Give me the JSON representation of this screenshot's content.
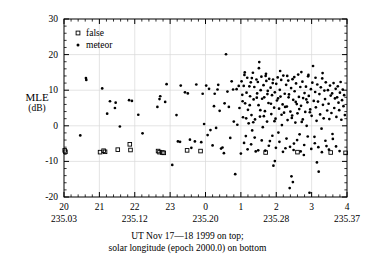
{
  "figure": {
    "title": "",
    "background_color": "#ffffff",
    "frame_color": "#000000",
    "grid_color": "#d8d8d8"
  },
  "axis_label_y": {
    "name": "MLE",
    "unit": "(dB)"
  },
  "caption": {
    "line1": "UT Nov 17—18 1999 on top;",
    "line2": "solar longitude (epoch 2000.0) on bottom"
  },
  "legend": {
    "entries": [
      {
        "label": "false",
        "marker": "open-square"
      },
      {
        "label": "meteor",
        "marker": "filled-dot"
      }
    ]
  },
  "chart_data": {
    "type": "scatter",
    "title": "",
    "xlabel": "UT Nov 17—18 1999 on top; solar longitude (epoch 2000.0) on bottom",
    "ylabel": "MLE (dB)",
    "xlim": [
      20.0,
      28.0
    ],
    "ylim": [
      -20,
      30
    ],
    "grid": true,
    "legend_position": "top-left",
    "x_axis_top_ticks": {
      "label": "UT Nov 17—18 1999",
      "tick_labels": [
        "20",
        "21",
        "22",
        "23",
        "0",
        "1",
        "2",
        "3",
        "4"
      ],
      "tick_values": [
        20,
        21,
        22,
        23,
        24,
        25,
        26,
        27,
        28
      ],
      "minor_ticks_per_interval": 5
    },
    "x_axis_bottom_ticks": {
      "label": "solar longitude (epoch 2000.0)",
      "tick_labels": [
        "235.03",
        "235.12",
        "235.20",
        "235.28",
        "235.37"
      ],
      "tick_values": [
        20,
        22,
        24,
        26,
        28
      ]
    },
    "y_axis_ticks": {
      "tick_labels": [
        "30",
        "20",
        "10",
        "0",
        "-10",
        "-20"
      ],
      "tick_values": [
        30,
        20,
        10,
        0,
        -10,
        -20
      ],
      "minor_tick_step": 2
    },
    "series": [
      {
        "name": "false",
        "marker": "open-square",
        "color": "#000000",
        "points": [
          [
            20.02,
            -6.9
          ],
          [
            20.04,
            -7.3
          ],
          [
            21.02,
            -7.4
          ],
          [
            21.12,
            -7.0
          ],
          [
            21.16,
            -7.3
          ],
          [
            21.52,
            -6.7
          ],
          [
            21.86,
            -5.2
          ],
          [
            21.88,
            -6.8
          ],
          [
            22.66,
            -7.1
          ],
          [
            22.7,
            -7.4
          ],
          [
            22.78,
            -7.5
          ],
          [
            22.82,
            -7.6
          ],
          [
            23.48,
            -6.9
          ],
          [
            23.86,
            -7.1
          ],
          [
            25.7,
            -7.5
          ],
          [
            26.6,
            -7.4
          ],
          [
            27.54,
            -7.5
          ],
          [
            27.96,
            -7.6
          ]
        ]
      },
      {
        "name": "meteor",
        "marker": "filled-dot",
        "color": "#000000",
        "points": [
          [
            20.62,
            13.4
          ],
          [
            20.63,
            12.9
          ],
          [
            20.46,
            -2.7
          ],
          [
            21.08,
            10.5
          ],
          [
            21.3,
            6.9
          ],
          [
            21.22,
            3.4
          ],
          [
            21.44,
            5.0
          ],
          [
            21.46,
            6.5
          ],
          [
            21.58,
            -0.2
          ],
          [
            21.84,
            7.2
          ],
          [
            21.92,
            7.0
          ],
          [
            22.1,
            3.1
          ],
          [
            22.22,
            -2.1
          ],
          [
            22.64,
            5.3
          ],
          [
            22.7,
            7.5
          ],
          [
            22.72,
            8.3
          ],
          [
            22.9,
            11.7
          ],
          [
            22.86,
            6.7
          ],
          [
            23.06,
            -11.0
          ],
          [
            23.18,
            3.0
          ],
          [
            23.22,
            -4.4
          ],
          [
            23.28,
            -4.5
          ],
          [
            23.3,
            11.3
          ],
          [
            23.42,
            9.4
          ],
          [
            23.5,
            9.1
          ],
          [
            23.56,
            -3.9
          ],
          [
            23.6,
            -6.2
          ],
          [
            23.7,
            -4.4
          ],
          [
            23.74,
            11.6
          ],
          [
            23.88,
            -4.6
          ],
          [
            23.92,
            9.0
          ],
          [
            23.96,
            0.5
          ],
          [
            24.02,
            11.3
          ],
          [
            24.06,
            -2.6
          ],
          [
            24.1,
            10.4
          ],
          [
            24.14,
            -1.2
          ],
          [
            24.2,
            -5.5
          ],
          [
            24.24,
            5.5
          ],
          [
            24.26,
            9.0
          ],
          [
            24.3,
            -0.6
          ],
          [
            24.34,
            10.2
          ],
          [
            24.36,
            11.5
          ],
          [
            24.4,
            4.2
          ],
          [
            24.44,
            -6.4
          ],
          [
            24.48,
            -6.1
          ],
          [
            24.52,
            -7.7
          ],
          [
            24.54,
            6.3
          ],
          [
            24.58,
            20.1
          ],
          [
            24.62,
            9.6
          ],
          [
            24.66,
            5.3
          ],
          [
            24.7,
            -3.4
          ],
          [
            24.74,
            12.5
          ],
          [
            24.78,
            10.2
          ],
          [
            24.8,
            1.2
          ],
          [
            24.84,
            -13.6
          ],
          [
            24.88,
            10.3
          ],
          [
            24.9,
            0.3
          ],
          [
            24.94,
            11.2
          ],
          [
            24.96,
            5.0
          ],
          [
            25.0,
            -7.8
          ],
          [
            25.02,
            12.5
          ],
          [
            25.04,
            8.7
          ],
          [
            25.06,
            2.4
          ],
          [
            25.08,
            11.2
          ],
          [
            25.1,
            14.3
          ],
          [
            25.12,
            6.3
          ],
          [
            25.14,
            -2.9
          ],
          [
            25.16,
            9.3
          ],
          [
            25.18,
            13.5
          ],
          [
            25.2,
            4.5
          ],
          [
            25.22,
            0.7
          ],
          [
            25.24,
            11.1
          ],
          [
            25.26,
            8.3
          ],
          [
            25.28,
            12.2
          ],
          [
            25.3,
            3.0
          ],
          [
            25.32,
            -1.3
          ],
          [
            25.34,
            14.9
          ],
          [
            25.36,
            7.4
          ],
          [
            25.38,
            10.9
          ],
          [
            25.4,
            1.8
          ],
          [
            25.42,
            -7.2
          ],
          [
            25.44,
            13.0
          ],
          [
            25.46,
            9.1
          ],
          [
            25.48,
            12.3
          ],
          [
            25.5,
            5.8
          ],
          [
            25.52,
            17.9
          ],
          [
            25.54,
            2.6
          ],
          [
            25.56,
            10.0
          ],
          [
            25.58,
            13.8
          ],
          [
            25.6,
            7.6
          ],
          [
            25.62,
            -0.4
          ],
          [
            25.64,
            11.4
          ],
          [
            25.66,
            8.0
          ],
          [
            25.68,
            4.1
          ],
          [
            25.7,
            14.0
          ],
          [
            25.72,
            12.6
          ],
          [
            25.74,
            1.2
          ],
          [
            25.76,
            9.8
          ],
          [
            25.78,
            6.4
          ],
          [
            25.8,
            13.2
          ],
          [
            25.82,
            -4.3
          ],
          [
            25.84,
            10.7
          ],
          [
            25.86,
            3.3
          ],
          [
            25.88,
            8.6
          ],
          [
            25.9,
            12.0
          ],
          [
            25.92,
            -11.2
          ],
          [
            25.94,
            5.1
          ],
          [
            25.96,
            9.4
          ],
          [
            25.98,
            2.0
          ],
          [
            26.0,
            11.8
          ],
          [
            26.02,
            7.1
          ],
          [
            26.04,
            13.6
          ],
          [
            26.06,
            -1.9
          ],
          [
            26.08,
            4.8
          ],
          [
            26.1,
            10.1
          ],
          [
            26.12,
            8.2
          ],
          [
            26.14,
            12.9
          ],
          [
            26.16,
            0.2
          ],
          [
            26.18,
            6.0
          ],
          [
            26.2,
            14.1
          ],
          [
            26.22,
            3.7
          ],
          [
            26.24,
            9.0
          ],
          [
            26.26,
            -6.3
          ],
          [
            26.28,
            11.5
          ],
          [
            26.3,
            5.4
          ],
          [
            26.32,
            1.6
          ],
          [
            26.34,
            12.7
          ],
          [
            26.36,
            8.8
          ],
          [
            26.38,
            -17.5
          ],
          [
            26.4,
            4.0
          ],
          [
            26.42,
            10.6
          ],
          [
            26.44,
            2.2
          ],
          [
            26.46,
            13.1
          ],
          [
            26.48,
            7.3
          ],
          [
            26.5,
            -5.0
          ],
          [
            26.52,
            9.7
          ],
          [
            26.54,
            0.9
          ],
          [
            26.56,
            11.9
          ],
          [
            26.58,
            6.1
          ],
          [
            26.6,
            3.5
          ],
          [
            26.62,
            14.4
          ],
          [
            26.64,
            8.1
          ],
          [
            26.66,
            -2.4
          ],
          [
            26.68,
            10.9
          ],
          [
            26.7,
            5.6
          ],
          [
            26.72,
            1.1
          ],
          [
            26.74,
            12.4
          ],
          [
            26.76,
            7.8
          ],
          [
            26.78,
            -8.2
          ],
          [
            26.8,
            9.2
          ],
          [
            26.82,
            3.9
          ],
          [
            26.84,
            11.0
          ],
          [
            26.86,
            0.0
          ],
          [
            26.88,
            6.6
          ],
          [
            26.9,
            13.9
          ],
          [
            26.92,
            8.4
          ],
          [
            26.94,
            -18.8
          ],
          [
            26.96,
            4.6
          ],
          [
            26.98,
            10.3
          ],
          [
            27.0,
            2.8
          ],
          [
            27.02,
            12.1
          ],
          [
            27.04,
            16.8
          ],
          [
            27.06,
            7.0
          ],
          [
            27.08,
            -3.1
          ],
          [
            27.1,
            9.5
          ],
          [
            27.12,
            5.2
          ],
          [
            27.14,
            1.4
          ],
          [
            27.16,
            11.6
          ],
          [
            27.18,
            6.8
          ],
          [
            27.2,
            -12.9
          ],
          [
            27.22,
            8.9
          ],
          [
            27.24,
            3.2
          ],
          [
            27.26,
            10.8
          ],
          [
            27.28,
            -0.8
          ],
          [
            27.3,
            13.3
          ],
          [
            27.32,
            5.9
          ],
          [
            27.34,
            2.1
          ],
          [
            27.36,
            9.9
          ],
          [
            27.38,
            7.5
          ],
          [
            27.4,
            12.2
          ],
          [
            27.42,
            -5.7
          ],
          [
            27.44,
            4.3
          ],
          [
            27.46,
            10.0
          ],
          [
            27.48,
            6.2
          ],
          [
            27.5,
            1.9
          ],
          [
            27.52,
            11.3
          ],
          [
            27.54,
            8.5
          ],
          [
            27.56,
            3.6
          ],
          [
            27.58,
            9.1
          ],
          [
            27.6,
            -3.7
          ],
          [
            27.62,
            12.0
          ],
          [
            27.64,
            5.0
          ],
          [
            27.66,
            7.7
          ],
          [
            27.68,
            10.4
          ],
          [
            27.7,
            2.5
          ],
          [
            27.72,
            8.0
          ],
          [
            27.74,
            11.1
          ],
          [
            27.76,
            6.5
          ],
          [
            27.78,
            4.4
          ],
          [
            27.8,
            9.3
          ],
          [
            27.82,
            12.3
          ],
          [
            27.84,
            1.7
          ],
          [
            27.86,
            7.2
          ],
          [
            27.88,
            10.2
          ],
          [
            27.9,
            5.5
          ],
          [
            27.92,
            8.6
          ],
          [
            27.94,
            3.0
          ],
          [
            25.05,
            6.9
          ],
          [
            25.15,
            2.1
          ],
          [
            25.25,
            5.8
          ],
          [
            25.35,
            1.0
          ],
          [
            25.45,
            7.9
          ],
          [
            25.55,
            4.4
          ],
          [
            25.65,
            2.7
          ],
          [
            25.75,
            8.9
          ],
          [
            25.85,
            6.2
          ],
          [
            25.95,
            1.3
          ],
          [
            26.05,
            7.7
          ],
          [
            26.15,
            3.1
          ],
          [
            26.25,
            5.3
          ],
          [
            26.35,
            8.0
          ],
          [
            26.45,
            2.9
          ],
          [
            26.55,
            6.7
          ],
          [
            26.65,
            4.7
          ],
          [
            26.75,
            1.8
          ],
          [
            26.85,
            7.4
          ],
          [
            26.95,
            3.8
          ],
          [
            25.09,
            -4.8
          ],
          [
            25.19,
            -6.6
          ],
          [
            25.29,
            -5.2
          ],
          [
            25.39,
            -3.3
          ],
          [
            25.49,
            -6.9
          ],
          [
            25.59,
            -4.1
          ],
          [
            25.69,
            -7.0
          ],
          [
            25.79,
            -5.6
          ],
          [
            25.89,
            -2.8
          ],
          [
            25.99,
            -6.2
          ],
          [
            26.09,
            -4.5
          ],
          [
            26.19,
            -7.3
          ],
          [
            26.29,
            -3.6
          ],
          [
            26.39,
            -5.9
          ],
          [
            26.49,
            -6.8
          ],
          [
            26.59,
            -4.0
          ],
          [
            26.69,
            -7.2
          ],
          [
            26.79,
            -5.4
          ],
          [
            26.89,
            -3.0
          ],
          [
            26.99,
            -6.5
          ],
          [
            27.09,
            -4.9
          ],
          [
            27.19,
            -6.0
          ],
          [
            27.29,
            -7.4
          ],
          [
            27.39,
            -4.2
          ],
          [
            27.49,
            -6.7
          ],
          [
            27.59,
            -2.3
          ],
          [
            27.69,
            -5.8
          ],
          [
            27.79,
            -7.1
          ],
          [
            25.11,
            15.0
          ],
          [
            25.31,
            13.4
          ],
          [
            25.51,
            16.2
          ],
          [
            25.71,
            14.6
          ],
          [
            25.91,
            13.0
          ],
          [
            26.11,
            15.4
          ],
          [
            26.31,
            14.0
          ],
          [
            26.51,
            13.7
          ],
          [
            26.71,
            15.1
          ],
          [
            26.91,
            14.3
          ],
          [
            27.11,
            13.5
          ],
          [
            27.31,
            14.8
          ],
          [
            26.43,
            -14.2
          ],
          [
            26.47,
            -15.8
          ],
          [
            25.96,
            -9.9
          ],
          [
            27.15,
            -10.3
          ]
        ]
      }
    ]
  }
}
